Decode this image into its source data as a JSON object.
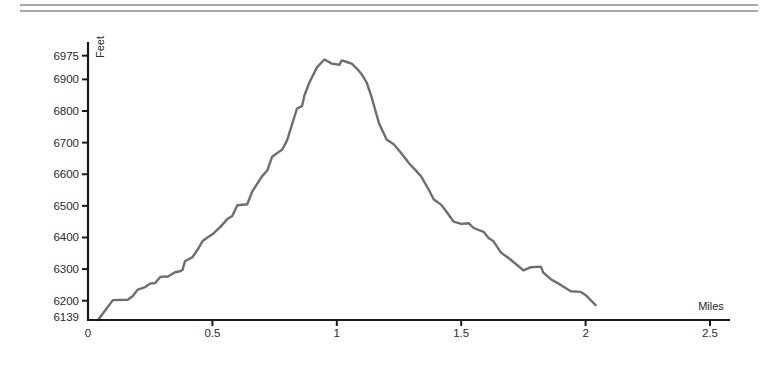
{
  "header": {
    "rule_color": "#a8a8a8"
  },
  "chart_data": {
    "type": "line",
    "title": "",
    "xlabel": "Miles",
    "ylabel": "Feet",
    "xlim": [
      0,
      2.55
    ],
    "ylim": [
      6139,
      6975
    ],
    "x_ticks": [
      0,
      0.5,
      1,
      1.5,
      2,
      2.5
    ],
    "x_tick_labels": [
      "0",
      "0.5",
      "1",
      "1.5",
      "2",
      "2.5"
    ],
    "y_ticks": [
      6139,
      6200,
      6300,
      6400,
      6500,
      6600,
      6700,
      6800,
      6900,
      6975
    ],
    "y_tick_labels": [
      "6139",
      "6200",
      "6300",
      "6400",
      "6500",
      "6600",
      "6700",
      "6800",
      "6900",
      "6975"
    ],
    "grid": false,
    "legend": null,
    "line_color": "#6e6e6e",
    "axis_color": "#1a1a1a",
    "series": [
      {
        "name": "Elevation",
        "x": [
          0.04,
          0.1,
          0.16,
          0.18,
          0.2,
          0.23,
          0.25,
          0.27,
          0.29,
          0.31,
          0.32,
          0.35,
          0.37,
          0.38,
          0.39,
          0.42,
          0.44,
          0.46,
          0.48,
          0.5,
          0.53,
          0.56,
          0.58,
          0.6,
          0.64,
          0.66,
          0.7,
          0.72,
          0.74,
          0.78,
          0.8,
          0.84,
          0.86,
          0.87,
          0.89,
          0.92,
          0.95,
          0.98,
          1.01,
          1.02,
          1.04,
          1.06,
          1.08,
          1.1,
          1.12,
          1.14,
          1.17,
          1.2,
          1.23,
          1.26,
          1.29,
          1.32,
          1.34,
          1.37,
          1.39,
          1.42,
          1.44,
          1.47,
          1.5,
          1.53,
          1.55,
          1.59,
          1.61,
          1.63,
          1.66,
          1.69,
          1.72,
          1.75,
          1.78,
          1.82,
          1.83,
          1.86,
          1.9,
          1.94,
          1.98,
          2.0,
          2.04
        ],
        "y": [
          6139,
          6202,
          6203,
          6215,
          6235,
          6243,
          6254,
          6256,
          6275,
          6277,
          6276,
          6290,
          6293,
          6297,
          6325,
          6338,
          6361,
          6388,
          6400,
          6410,
          6432,
          6458,
          6468,
          6502,
          6505,
          6545,
          6594,
          6611,
          6655,
          6678,
          6706,
          6808,
          6815,
          6850,
          6890,
          6938,
          6963,
          6950,
          6946,
          6960,
          6955,
          6950,
          6935,
          6916,
          6890,
          6844,
          6760,
          6710,
          6694,
          6666,
          6635,
          6610,
          6592,
          6550,
          6520,
          6503,
          6482,
          6450,
          6443,
          6445,
          6430,
          6418,
          6398,
          6388,
          6352,
          6335,
          6316,
          6296,
          6306,
          6308,
          6289,
          6268,
          6250,
          6230,
          6228,
          6218,
          6186
        ]
      }
    ]
  }
}
